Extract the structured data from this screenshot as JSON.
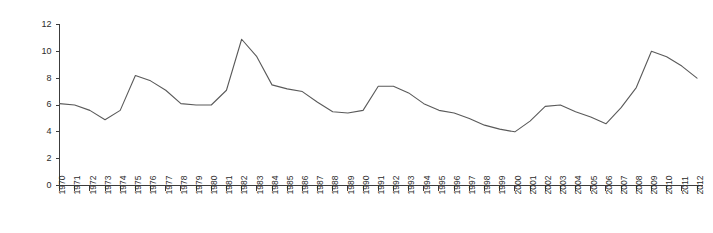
{
  "chart_data": {
    "type": "line",
    "title": "",
    "subtitle": "",
    "xlabel": "",
    "ylabel": "",
    "xlim": [
      1970,
      2012
    ],
    "ylim": [
      0,
      12
    ],
    "grid": false,
    "legend": null,
    "y_ticks": [
      0,
      2,
      4,
      6,
      8,
      10,
      12
    ],
    "y_tick_labels": [
      "0",
      "2",
      "4",
      "6",
      "8",
      "10",
      "12"
    ],
    "categories": [
      "1970",
      "1971",
      "1972",
      "1973",
      "1974",
      "1975",
      "1976",
      "1977",
      "1978",
      "1979",
      "1980",
      "1981",
      "1982",
      "1983",
      "1984",
      "1985",
      "1986",
      "1987",
      "1988",
      "1989",
      "1990",
      "1991",
      "1992",
      "1993",
      "1994",
      "1995",
      "1996",
      "1997",
      "1998",
      "1999",
      "2000",
      "2001",
      "2002",
      "2003",
      "2004",
      "2005",
      "2006",
      "2007",
      "2008",
      "2009",
      "2010",
      "2011",
      "2012"
    ],
    "values": [
      6.1,
      6.0,
      5.6,
      4.9,
      5.6,
      8.2,
      7.8,
      7.1,
      6.1,
      6.0,
      6.0,
      7.1,
      10.9,
      9.6,
      7.5,
      7.2,
      7.0,
      6.2,
      5.5,
      5.4,
      5.6,
      7.4,
      7.4,
      6.9,
      6.1,
      5.6,
      5.4,
      5.0,
      4.5,
      4.2,
      4.0,
      4.8,
      5.9,
      6.0,
      5.5,
      5.1,
      4.6,
      5.8,
      7.3,
      10.0,
      9.6,
      8.9,
      8.0
    ],
    "line_color": "#5a5a5a",
    "axis_color": "#3c3c3c",
    "background_color": "#ffffff"
  }
}
